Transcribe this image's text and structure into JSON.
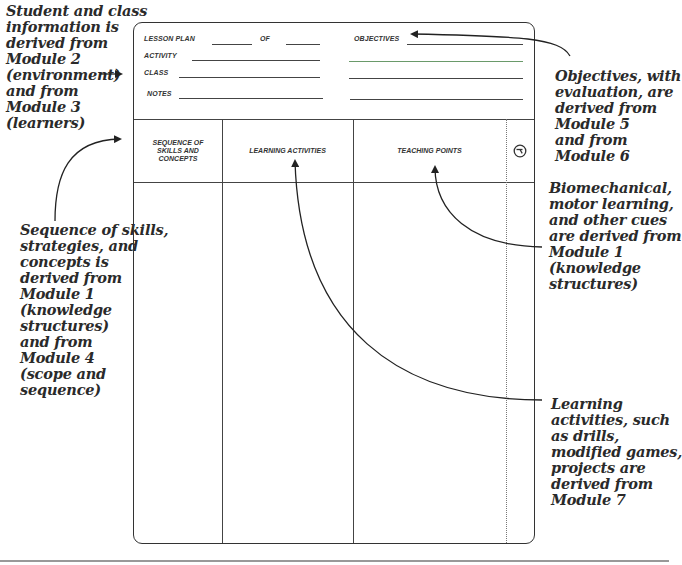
{
  "form": {
    "fields": {
      "lesson_plan": "LESSON PLAN",
      "of": "OF",
      "activity": "ACTIVITY",
      "class": "CLASS",
      "notes": "NOTES",
      "objectives": "OBJECTIVES"
    },
    "columns": [
      {
        "label": "SEQUENCE OF\nSKILLS AND\nCONCEPTS"
      },
      {
        "label": "LEARNING ACTIVITIES"
      },
      {
        "label": "TEACHING POINTS"
      },
      {
        "icon": "clock-icon"
      }
    ],
    "accent_line_color": "#7fc47f"
  },
  "annotations": {
    "student_class": "Student and class\ninformation is\nderived from\nModule 2\n(environment)\nand from\nModule 3\n(learners)",
    "sequence": "Sequence of skills,\nstrategies, and\nconcepts is\nderived from\nModule 1\n(knowledge\nstructures)\nand from\nModule 4\n(scope and\nsequence)",
    "objectives": "Objectives, with\nevaluation, are\nderived from\nModule 5\nand from\nModule 6",
    "teaching_points": "Biomechanical,\nmotor learning,\nand other cues\nare derived from\nModule 1\n(knowledge\nstructures)",
    "learning_activities": "Learning\nactivities, such\nas drills,\nmodified games,\nprojects are\nderived from\nModule 7"
  }
}
